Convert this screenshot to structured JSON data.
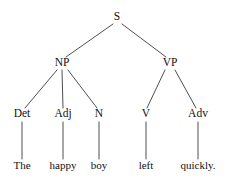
{
  "figure": {
    "kind": "constituency-syntax-tree",
    "sentence": "The happy boy left quickly.",
    "background_color": "#ffffff",
    "line_color": "#3a3a3a",
    "text_color": "#111111"
  },
  "nodes": {
    "s": {
      "label": "S",
      "x": 117,
      "y": 20
    },
    "np": {
      "label": "NP",
      "x": 62,
      "y": 66
    },
    "vp": {
      "label": "VP",
      "x": 170,
      "y": 66
    },
    "det": {
      "label": "Det",
      "x": 22,
      "y": 117
    },
    "adj": {
      "label": "Adj",
      "x": 63,
      "y": 117
    },
    "n": {
      "label": "N",
      "x": 99,
      "y": 117
    },
    "v": {
      "label": "V",
      "x": 146,
      "y": 117
    },
    "adv": {
      "label": "Adv",
      "x": 198,
      "y": 117
    },
    "word_the": {
      "label": "The",
      "x": 22,
      "y": 169
    },
    "word_happy": {
      "label": "happy",
      "x": 63,
      "y": 169
    },
    "word_boy": {
      "label": "boy",
      "x": 99,
      "y": 169
    },
    "word_left": {
      "label": "left",
      "x": 146,
      "y": 169
    },
    "word_quickly": {
      "label": "quickly.",
      "x": 198,
      "y": 169
    }
  },
  "edges": [
    {
      "name": "edge-s-np",
      "x1": 113,
      "y1": 24,
      "x2": 66,
      "y2": 57
    },
    {
      "name": "edge-s-vp",
      "x1": 122,
      "y1": 24,
      "x2": 166,
      "y2": 57
    },
    {
      "name": "edge-np-det",
      "x1": 57,
      "y1": 70,
      "x2": 25,
      "y2": 108
    },
    {
      "name": "edge-np-adj",
      "x1": 62,
      "y1": 70,
      "x2": 63,
      "y2": 108
    },
    {
      "name": "edge-np-n",
      "x1": 68,
      "y1": 70,
      "x2": 97,
      "y2": 108
    },
    {
      "name": "edge-vp-v",
      "x1": 165,
      "y1": 70,
      "x2": 147,
      "y2": 108
    },
    {
      "name": "edge-vp-adv",
      "x1": 175,
      "y1": 70,
      "x2": 196,
      "y2": 108
    },
    {
      "name": "edge-det-the",
      "x1": 22,
      "y1": 122,
      "x2": 22,
      "y2": 159
    },
    {
      "name": "edge-adj-happy",
      "x1": 63,
      "y1": 122,
      "x2": 63,
      "y2": 159
    },
    {
      "name": "edge-n-boy",
      "x1": 99,
      "y1": 122,
      "x2": 99,
      "y2": 159
    },
    {
      "name": "edge-v-left",
      "x1": 146,
      "y1": 122,
      "x2": 146,
      "y2": 159
    },
    {
      "name": "edge-adv-quickly",
      "x1": 198,
      "y1": 122,
      "x2": 198,
      "y2": 159
    }
  ]
}
